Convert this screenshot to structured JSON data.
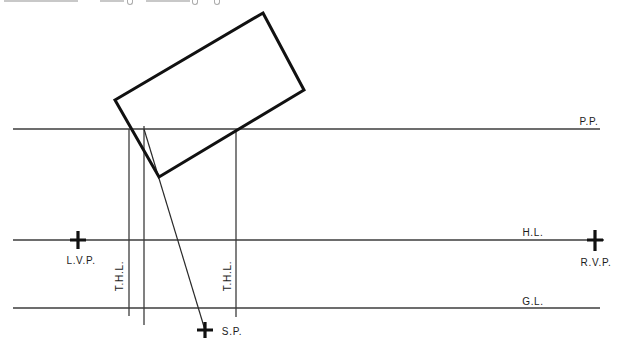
{
  "diagram": {
    "title_hint": "two-point perspective plan construction",
    "labels": {
      "picture_plane": "P.P.",
      "horizon_line": "H.L.",
      "ground_line": "G.L.",
      "left_vanishing_point": "L.V.P.",
      "right_vanishing_point": "R.V.P.",
      "station_point": "S.P.",
      "true_height_line": "T.H.L."
    },
    "colors": {
      "thin_line": "#3c3c3c",
      "heavy_line": "#111111",
      "text": "#1c1c1c",
      "background": "#ffffff"
    }
  }
}
